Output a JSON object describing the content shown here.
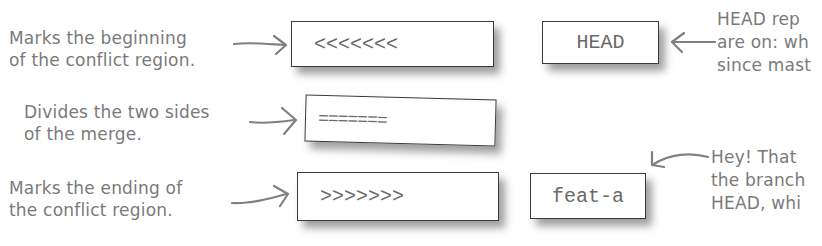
{
  "annotations": {
    "begin": {
      "lines": [
        "Marks the beginning",
        "of the conflict region."
      ]
    },
    "divide": {
      "lines": [
        "Divides the two sides",
        "of the merge."
      ]
    },
    "end": {
      "lines": [
        "Marks the ending of",
        "the conflict region."
      ]
    },
    "head_note": {
      "lines": [
        "HEAD rep",
        "are on: wh",
        "since mast"
      ]
    },
    "feat_note": {
      "lines": [
        "Hey! That",
        "the branch",
        "HEAD, whi"
      ]
    }
  },
  "boxes": {
    "conflict_start": "<<<<<<<",
    "divider": "=======",
    "conflict_end": ">>>>>>>",
    "head_ref": "HEAD",
    "branch_ref": "feat-a"
  },
  "colors": {
    "annotation_text": "#7a7a7a",
    "box_border": "#3a3a3a",
    "box_text": "#6a6a6a"
  }
}
